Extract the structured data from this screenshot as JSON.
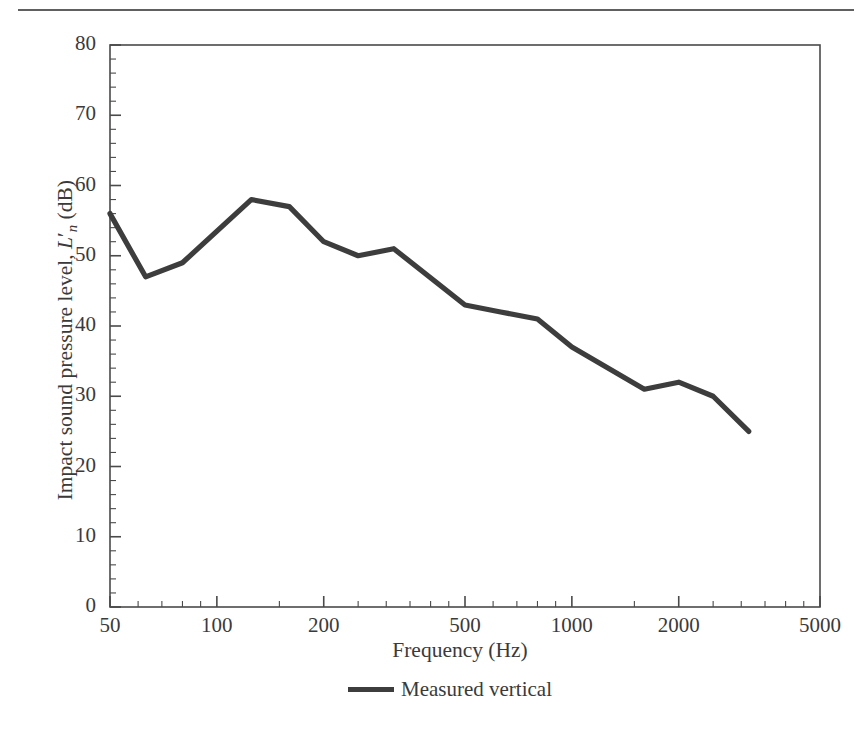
{
  "figure": {
    "page_rule": "horizontal-rule",
    "line_color": "#3d3d3d",
    "axis_color": "#4a4a4a",
    "background": "#ffffff"
  },
  "legend": {
    "position": "bottom-center",
    "entries": [
      {
        "label": "Measured vertical",
        "color": "#3d3d3d"
      }
    ]
  },
  "chart_data": {
    "type": "line",
    "title": "",
    "subtitle": "",
    "xlabel": "Frequency (Hz)",
    "ylabel": "Impact sound pressure level, L'n (dB)",
    "ylabel_parts": {
      "prefix": "Impact sound pressure level, ",
      "symbol": "L",
      "prime": "′",
      "subscript": "n",
      "units": " (dB)"
    },
    "xscale": "log",
    "xlim": [
      50,
      5000
    ],
    "ylim": [
      0,
      80
    ],
    "grid": false,
    "x_tick_labels": [
      "50",
      "100",
      "200",
      "500",
      "1000",
      "2000",
      "5000"
    ],
    "x_tick_values": [
      50,
      100,
      200,
      500,
      1000,
      2000,
      5000
    ],
    "x_minor_ticks": [
      60,
      70,
      80,
      90,
      150,
      250,
      300,
      350,
      400,
      450,
      600,
      700,
      800,
      900,
      1500,
      2500,
      3000,
      3500,
      4000,
      4500
    ],
    "y_tick_labels": [
      "0",
      "10",
      "20",
      "30",
      "40",
      "50",
      "60",
      "70",
      "80"
    ],
    "y_tick_values": [
      0,
      10,
      20,
      30,
      40,
      50,
      60,
      70,
      80
    ],
    "y_minor_step": 2,
    "series": [
      {
        "name": "Measured vertical",
        "color": "#3d3d3d",
        "x": [
          50,
          63,
          80,
          125,
          160,
          200,
          250,
          315,
          500,
          630,
          800,
          1000,
          1600,
          2000,
          2500,
          3150
        ],
        "values": [
          56,
          47,
          49,
          58,
          57,
          52,
          50,
          51,
          43,
          42,
          41,
          37,
          31,
          32,
          30,
          25
        ]
      }
    ]
  }
}
